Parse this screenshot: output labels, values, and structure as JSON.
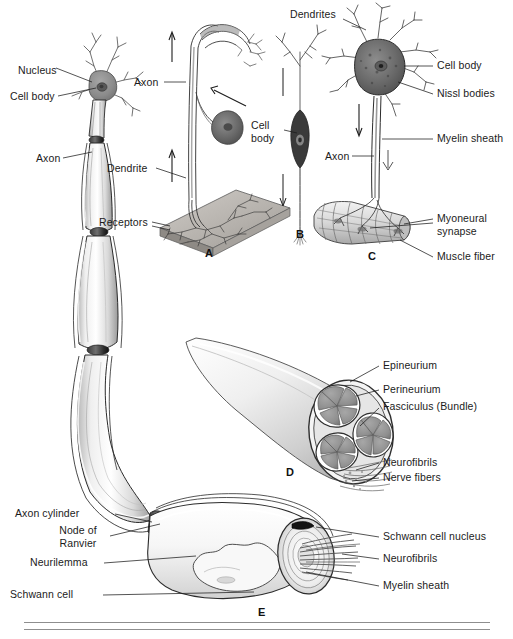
{
  "figure": {
    "background_color": "#ffffff",
    "ink_color": "#1b1b1b",
    "style": "grayscale medical illustration"
  },
  "panels": [
    {
      "id": "A",
      "name": "sensory-neuron",
      "x": 205,
      "y": 253
    },
    {
      "id": "B",
      "name": "bipolar-neuron",
      "x": 299,
      "y": 234
    },
    {
      "id": "C",
      "name": "motor-neuron",
      "x": 370,
      "y": 256
    },
    {
      "id": "D",
      "name": "nerve-cross-section",
      "x": 288,
      "y": 473
    },
    {
      "id": "E",
      "name": "myelinated-fiber-detail",
      "x": 260,
      "y": 614
    }
  ],
  "labels": {
    "main_neuron": [
      {
        "key": "nucleus",
        "text": "Nucleus",
        "x": 18,
        "y": 64
      },
      {
        "key": "cell_body",
        "text": "Cell body",
        "x": 10,
        "y": 95
      },
      {
        "key": "axon",
        "text": "Axon",
        "x": 36,
        "y": 160
      }
    ],
    "panel_a": [
      {
        "key": "axon",
        "text": "Axon",
        "x": 137,
        "y": 84
      },
      {
        "key": "dendrite",
        "text": "Dendrite",
        "x": 110,
        "y": 170
      },
      {
        "key": "receptors",
        "text": "Receptors",
        "x": 104,
        "y": 224
      }
    ],
    "panel_b": [
      {
        "key": "cell_body",
        "text": "Cell body",
        "x": 253,
        "y": 126,
        "width": 40
      },
      {
        "key": "axon",
        "text": "Axon",
        "x": 327,
        "y": 158
      }
    ],
    "panel_c": [
      {
        "key": "dendrites",
        "text": "Dendrites",
        "x": 293,
        "y": 12
      },
      {
        "key": "cell_body",
        "text": "Cell body",
        "x": 437,
        "y": 65
      },
      {
        "key": "nissl_bodies",
        "text": "Nissl bodies",
        "x": 437,
        "y": 93
      },
      {
        "key": "myelin_sheath",
        "text": "Myelin sheath",
        "x": 437,
        "y": 138
      },
      {
        "key": "myoneural_synapse",
        "text": "Myoneural synapse",
        "x": 437,
        "y": 218,
        "width": 70
      },
      {
        "key": "muscle_fiber",
        "text": "Muscle fiber",
        "x": 437,
        "y": 256
      }
    ],
    "panel_d": [
      {
        "key": "epineurium",
        "text": "Epineurium",
        "x": 383,
        "y": 365
      },
      {
        "key": "perineurium",
        "text": "Perineurium",
        "x": 383,
        "y": 389
      },
      {
        "key": "fasciculus",
        "text": "Fasciculus (Bundle)",
        "x": 383,
        "y": 406
      },
      {
        "key": "neurofibrils",
        "text": "Neurofibrils",
        "x": 383,
        "y": 462
      },
      {
        "key": "nerve_fibers",
        "text": "Nerve fibers",
        "x": 383,
        "y": 477
      }
    ],
    "panel_e": [
      {
        "key": "axon_cylinder",
        "text": "Axon cylinder",
        "x": 18,
        "y": 513
      },
      {
        "key": "node_of_ranvier",
        "text": "Node of Ranvier",
        "x": 50,
        "y": 532,
        "width": 56
      },
      {
        "key": "neurilemma",
        "text": "Neurilemma",
        "x": 33,
        "y": 562
      },
      {
        "key": "schwann_cell",
        "text": "Schwann cell",
        "x": 12,
        "y": 594
      },
      {
        "key": "schwann_cell_nucleus",
        "text": "Schwann cell nucleus",
        "x": 383,
        "y": 536
      },
      {
        "key": "neurofibrils",
        "text": "Neurofibrils",
        "x": 383,
        "y": 558
      },
      {
        "key": "myelin_sheath",
        "text": "Myelin sheath",
        "x": 383,
        "y": 585
      }
    ]
  },
  "rules": [
    {
      "key": "rule_top",
      "y": 622
    },
    {
      "key": "rule_bottom",
      "y": 629
    }
  ]
}
